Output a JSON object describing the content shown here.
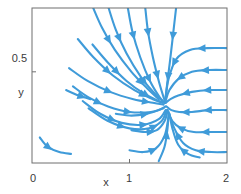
{
  "chart_data": {
    "type": "line",
    "subtype": "phase-portrait-streamplot",
    "title": "",
    "subtitle": "",
    "xlabel": "x",
    "ylabel": "y",
    "xlim": [
      0,
      2
    ],
    "ylim": [
      0,
      0.85
    ],
    "grid": false,
    "legend": null,
    "line_color": "#3f9bd9",
    "arrow_color": "#3f9bd9",
    "frame_color": "#6f6f6f",
    "background": "#ffffff",
    "xticks": [
      0,
      1,
      2
    ],
    "xticklabels": [
      "0",
      "1",
      "2"
    ],
    "yticks": [
      0.5
    ],
    "yticklabels": [
      "0.5"
    ],
    "annotations": [],
    "fixed_point": {
      "x": 1.35,
      "y": 0.33,
      "kind": "stable-node"
    },
    "streamlines": [
      {
        "name": "top-left-inflow-1",
        "points": [
          [
            0.62,
            0.86
          ],
          [
            0.72,
            0.74
          ],
          [
            0.85,
            0.62
          ],
          [
            1.02,
            0.5
          ],
          [
            1.18,
            0.41
          ],
          [
            1.3,
            0.35
          ]
        ],
        "arrows": [
          0.32,
          0.78
        ]
      },
      {
        "name": "top-left-inflow-2",
        "points": [
          [
            0.78,
            0.86
          ],
          [
            0.86,
            0.73
          ],
          [
            0.97,
            0.6
          ],
          [
            1.12,
            0.47
          ],
          [
            1.26,
            0.38
          ],
          [
            1.34,
            0.34
          ]
        ],
        "arrows": [
          0.3,
          0.75
        ]
      },
      {
        "name": "top-mid-inflow-1",
        "points": [
          [
            0.98,
            0.86
          ],
          [
            1.03,
            0.72
          ],
          [
            1.11,
            0.58
          ],
          [
            1.21,
            0.45
          ],
          [
            1.31,
            0.36
          ],
          [
            1.36,
            0.33
          ]
        ],
        "arrows": [
          0.28,
          0.72
        ]
      },
      {
        "name": "top-mid-inflow-2",
        "points": [
          [
            1.16,
            0.86
          ],
          [
            1.19,
            0.72
          ],
          [
            1.24,
            0.58
          ],
          [
            1.3,
            0.45
          ],
          [
            1.35,
            0.36
          ],
          [
            1.37,
            0.33
          ]
        ],
        "arrows": [
          0.26,
          0.7
        ]
      },
      {
        "name": "top-right-inflow",
        "points": [
          [
            1.48,
            0.86
          ],
          [
            1.45,
            0.72
          ],
          [
            1.42,
            0.58
          ],
          [
            1.39,
            0.45
          ],
          [
            1.37,
            0.36
          ],
          [
            1.36,
            0.33
          ]
        ],
        "arrows": [
          0.3,
          0.72
        ]
      },
      {
        "name": "left-mid-curve-1",
        "points": [
          [
            0.47,
            0.68
          ],
          [
            0.63,
            0.58
          ],
          [
            0.83,
            0.48
          ],
          [
            1.05,
            0.4
          ],
          [
            1.24,
            0.35
          ],
          [
            1.34,
            0.33
          ]
        ],
        "arrows": [
          0.4,
          0.8
        ]
      },
      {
        "name": "left-mid-curve-2",
        "points": [
          [
            0.62,
            0.65
          ],
          [
            0.78,
            0.55
          ],
          [
            0.97,
            0.45
          ],
          [
            1.15,
            0.38
          ],
          [
            1.3,
            0.34
          ],
          [
            1.36,
            0.33
          ]
        ],
        "arrows": [
          0.38,
          0.78
        ]
      },
      {
        "name": "left-mid-curve-3",
        "points": [
          [
            0.38,
            0.52
          ],
          [
            0.57,
            0.45
          ],
          [
            0.8,
            0.39
          ],
          [
            1.04,
            0.35
          ],
          [
            1.24,
            0.33
          ],
          [
            1.35,
            0.32
          ]
        ],
        "arrows": [
          0.44,
          0.82
        ]
      },
      {
        "name": "left-low-curve-1",
        "points": [
          [
            0.42,
            0.42
          ],
          [
            0.58,
            0.36
          ],
          [
            0.78,
            0.31
          ],
          [
            1.0,
            0.28
          ],
          [
            1.22,
            0.28
          ],
          [
            1.35,
            0.3
          ]
        ],
        "arrows": [
          0.3,
          0.62
        ]
      },
      {
        "name": "left-low-curve-2",
        "points": [
          [
            0.52,
            0.34
          ],
          [
            0.7,
            0.27
          ],
          [
            0.92,
            0.22
          ],
          [
            1.14,
            0.21
          ],
          [
            1.3,
            0.24
          ],
          [
            1.37,
            0.29
          ]
        ],
        "arrows": [
          0.36,
          0.7
        ]
      },
      {
        "name": "left-low-curve-3",
        "points": [
          [
            0.58,
            0.3
          ],
          [
            0.78,
            0.23
          ],
          [
            1.0,
            0.19
          ],
          [
            1.2,
            0.19
          ],
          [
            1.33,
            0.23
          ],
          [
            1.38,
            0.29
          ]
        ],
        "arrows": [
          0.4,
          0.76
        ]
      },
      {
        "name": "left-short-stub",
        "points": [
          [
            0.35,
            0.4
          ],
          [
            0.48,
            0.37
          ],
          [
            0.6,
            0.35
          ]
        ],
        "arrows": [
          0.62
        ]
      },
      {
        "name": "bottom-left-detached",
        "points": [
          [
            0.08,
            0.14
          ],
          [
            0.16,
            0.09
          ],
          [
            0.28,
            0.06
          ],
          [
            0.4,
            0.05
          ]
        ],
        "arrows": [
          0.34
        ]
      },
      {
        "name": "right-inflow-1",
        "points": [
          [
            2.0,
            0.63
          ],
          [
            1.8,
            0.63
          ],
          [
            1.62,
            0.62
          ],
          [
            1.48,
            0.57
          ],
          [
            1.4,
            0.46
          ],
          [
            1.37,
            0.35
          ]
        ],
        "arrows": [
          0.26,
          0.6
        ]
      },
      {
        "name": "right-inflow-2",
        "points": [
          [
            2.0,
            0.51
          ],
          [
            1.82,
            0.51
          ],
          [
            1.64,
            0.5
          ],
          [
            1.5,
            0.46
          ],
          [
            1.41,
            0.4
          ],
          [
            1.37,
            0.34
          ]
        ],
        "arrows": [
          0.28,
          0.62
        ]
      },
      {
        "name": "right-inflow-3",
        "points": [
          [
            2.0,
            0.4
          ],
          [
            1.82,
            0.4
          ],
          [
            1.64,
            0.39
          ],
          [
            1.5,
            0.37
          ],
          [
            1.42,
            0.35
          ],
          [
            1.37,
            0.33
          ]
        ],
        "arrows": [
          0.3,
          0.64
        ]
      },
      {
        "name": "right-inflow-4",
        "points": [
          [
            2.0,
            0.29
          ],
          [
            1.82,
            0.29
          ],
          [
            1.64,
            0.28
          ],
          [
            1.51,
            0.28
          ],
          [
            1.43,
            0.29
          ],
          [
            1.38,
            0.31
          ]
        ],
        "arrows": [
          0.3,
          0.66
        ]
      },
      {
        "name": "right-inflow-5",
        "points": [
          [
            2.0,
            0.17
          ],
          [
            1.82,
            0.17
          ],
          [
            1.66,
            0.17
          ],
          [
            1.53,
            0.19
          ],
          [
            1.44,
            0.23
          ],
          [
            1.39,
            0.29
          ]
        ],
        "arrows": [
          0.3,
          0.66
        ]
      },
      {
        "name": "right-inflow-6",
        "points": [
          [
            2.0,
            0.06
          ],
          [
            1.84,
            0.06
          ],
          [
            1.68,
            0.07
          ],
          [
            1.55,
            0.11
          ],
          [
            1.46,
            0.19
          ],
          [
            1.4,
            0.28
          ]
        ],
        "arrows": [
          0.32,
          0.68
        ]
      },
      {
        "name": "lower-mid-inflow-1",
        "points": [
          [
            1.02,
            0.18
          ],
          [
            1.16,
            0.17
          ],
          [
            1.28,
            0.18
          ],
          [
            1.36,
            0.23
          ],
          [
            1.39,
            0.29
          ]
        ],
        "arrows": [
          0.38
        ]
      },
      {
        "name": "lower-mid-inflow-2",
        "points": [
          [
            1.0,
            0.07
          ],
          [
            1.14,
            0.06
          ],
          [
            1.27,
            0.08
          ],
          [
            1.36,
            0.15
          ],
          [
            1.4,
            0.25
          ]
        ],
        "arrows": [
          0.38
        ]
      },
      {
        "name": "bottom-mid-inflow",
        "points": [
          [
            1.3,
            0.01
          ],
          [
            1.36,
            0.09
          ],
          [
            1.39,
            0.19
          ],
          [
            1.4,
            0.27
          ]
        ],
        "arrows": [
          0.55
        ]
      },
      {
        "name": "bottom-right-inflow",
        "points": [
          [
            1.72,
            0.03
          ],
          [
            1.6,
            0.05
          ],
          [
            1.5,
            0.1
          ],
          [
            1.44,
            0.19
          ],
          [
            1.41,
            0.27
          ]
        ],
        "arrows": [
          0.3
        ]
      },
      {
        "name": "mid-horizontal-inflow",
        "points": [
          [
            0.86,
            0.27
          ],
          [
            1.02,
            0.26
          ],
          [
            1.18,
            0.27
          ],
          [
            1.3,
            0.29
          ],
          [
            1.37,
            0.31
          ]
        ],
        "arrows": [
          0.55
        ]
      }
    ]
  },
  "axes": {
    "xlabel": "x",
    "ylabel": "y",
    "x_tick_labels": [
      "0",
      "1",
      "2"
    ],
    "y_tick_labels": [
      "0.5"
    ]
  }
}
